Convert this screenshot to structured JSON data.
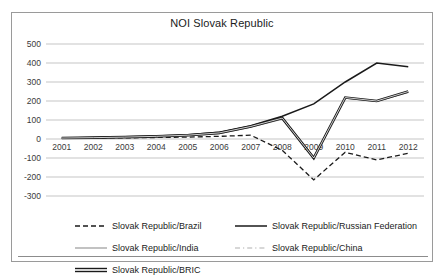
{
  "chart_data": {
    "type": "line",
    "title": "NOI Slovak Republic",
    "xlabel": "",
    "ylabel": "",
    "x": [
      2001,
      2002,
      2003,
      2004,
      2005,
      2006,
      2007,
      2008,
      2009,
      2010,
      2011,
      2012
    ],
    "xticklabels": [
      "2001",
      "2002",
      "2003",
      "2004",
      "2005",
      "2006",
      "2007",
      "2008",
      "2009",
      "2010",
      "2011",
      "2012"
    ],
    "yticklabels": [
      "500",
      "400",
      "300",
      "200",
      "100",
      "0",
      "-100",
      "-200",
      "-300"
    ],
    "yticks": [
      500,
      400,
      300,
      200,
      100,
      0,
      -100,
      -200,
      -300
    ],
    "ylim": [
      -300,
      500
    ],
    "grid": true,
    "legend_position": "bottom",
    "series": [
      {
        "name": "Slovak Republic/Brazil",
        "style": "dashed",
        "color": "#1a1a1a",
        "width": 1.3,
        "values": [
          3,
          5,
          6,
          8,
          10,
          14,
          20,
          -60,
          -215,
          -70,
          -110,
          -75
        ]
      },
      {
        "name": "Slovak Republic/Russian Federation",
        "style": "solid",
        "color": "#1a1a1a",
        "width": 1.5,
        "values": [
          5,
          8,
          12,
          16,
          22,
          35,
          70,
          120,
          185,
          300,
          400,
          380
        ]
      },
      {
        "name": "Slovak Republic/India",
        "style": "solid",
        "color": "#9a9a9a",
        "width": 1.2,
        "values": [
          4,
          6,
          9,
          12,
          18,
          28,
          62,
          105,
          -95,
          215,
          198,
          245
        ]
      },
      {
        "name": "Slovak Republic/China",
        "style": "dashdot",
        "color": "#b0b0b0",
        "width": 1.2,
        "values": [
          4,
          6,
          9,
          13,
          19,
          30,
          64,
          108,
          -98,
          218,
          200,
          248
        ]
      },
      {
        "name": "Slovak Republic/BRIC",
        "style": "double",
        "color": "#1a1a1a",
        "width": 2.6,
        "values": [
          5,
          7,
          10,
          14,
          20,
          32,
          66,
          110,
          -100,
          218,
          200,
          250
        ]
      }
    ]
  },
  "legend": {
    "items": [
      {
        "label": "Slovak Republic/Brazil"
      },
      {
        "label": "Slovak Republic/Russian Federation"
      },
      {
        "label": "Slovak Republic/India"
      },
      {
        "label": "Slovak Republic/China"
      },
      {
        "label": "Slovak Republic/BRIC"
      }
    ]
  }
}
